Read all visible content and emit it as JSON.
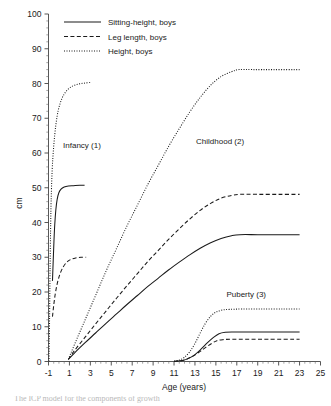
{
  "chart_data": {
    "type": "line",
    "title": "",
    "xlabel": "Age (years)",
    "ylabel": "cm",
    "xlim": [
      -1,
      25
    ],
    "ylim": [
      0,
      100
    ],
    "xticks": [
      -1,
      1,
      3,
      5,
      7,
      9,
      11,
      13,
      15,
      17,
      19,
      21,
      23,
      25
    ],
    "yticks": [
      0,
      10,
      20,
      30,
      40,
      50,
      60,
      70,
      80,
      90,
      100
    ],
    "grid": false,
    "legend_position": "top-left",
    "legend": [
      {
        "label": "Sitting-height, boys",
        "style": "solid"
      },
      {
        "label": "Leg length, boys",
        "style": "dashed"
      },
      {
        "label": "Height, boys",
        "style": "dotted"
      }
    ],
    "annotations": [
      {
        "text": "Infancy (1)",
        "x": 2.2,
        "y": 61.5
      },
      {
        "text": "Childhood (2)",
        "x": 15.4,
        "y": 62.5
      },
      {
        "text": "Puberty (3)",
        "x": 17.9,
        "y": 18.6
      }
    ],
    "series": [
      {
        "name": "Infancy - Height, boys",
        "component": "infancy",
        "measure": "height",
        "style": "dotted",
        "points": [
          [
            -0.95,
            0
          ],
          [
            -0.9,
            12
          ],
          [
            -0.85,
            27
          ],
          [
            -0.8,
            38
          ],
          [
            -0.75,
            46
          ],
          [
            -0.65,
            55
          ],
          [
            -0.5,
            62
          ],
          [
            -0.3,
            68
          ],
          [
            -0.05,
            72.5
          ],
          [
            0.3,
            75.8
          ],
          [
            0.7,
            77.8
          ],
          [
            1.2,
            79.1
          ],
          [
            1.8,
            79.8
          ],
          [
            2.4,
            80.1
          ],
          [
            3.0,
            80.3
          ]
        ]
      },
      {
        "name": "Infancy - Sitting-height, boys",
        "component": "infancy",
        "measure": "sitting_height",
        "style": "solid",
        "points": [
          [
            -0.62,
            23.2
          ],
          [
            -0.55,
            29
          ],
          [
            -0.48,
            34.5
          ],
          [
            -0.4,
            39.5
          ],
          [
            -0.3,
            43.6
          ],
          [
            -0.18,
            46.5
          ],
          [
            -0.02,
            48.5
          ],
          [
            0.2,
            49.6
          ],
          [
            0.5,
            50.2
          ],
          [
            0.9,
            50.5
          ],
          [
            1.4,
            50.6
          ],
          [
            2.0,
            50.7
          ],
          [
            2.45,
            50.7
          ]
        ]
      },
      {
        "name": "Infancy - Leg length, boys",
        "component": "infancy",
        "measure": "leg_length",
        "style": "dashed",
        "points": [
          [
            -0.62,
            12.9
          ],
          [
            -0.5,
            16.2
          ],
          [
            -0.35,
            19.5
          ],
          [
            -0.15,
            22.6
          ],
          [
            0.1,
            25.2
          ],
          [
            0.4,
            27.2
          ],
          [
            0.75,
            28.6
          ],
          [
            1.15,
            29.4
          ],
          [
            1.6,
            29.8
          ],
          [
            2.1,
            30.0
          ],
          [
            2.6,
            30.0
          ]
        ]
      },
      {
        "name": "Childhood - Height, boys",
        "component": "childhood",
        "measure": "height",
        "style": "dotted",
        "points": [
          [
            0.9,
            0.6
          ],
          [
            1.5,
            5.0
          ],
          [
            2.5,
            12.0
          ],
          [
            3.5,
            19.0
          ],
          [
            4.5,
            26.0
          ],
          [
            5.5,
            32.5
          ],
          [
            6.5,
            39.0
          ],
          [
            7.5,
            45.0
          ],
          [
            8.5,
            51.0
          ],
          [
            9.5,
            56.5
          ],
          [
            10.5,
            62.0
          ],
          [
            11.5,
            67.0
          ],
          [
            12.5,
            71.8
          ],
          [
            13.5,
            76.0
          ],
          [
            14.5,
            79.5
          ],
          [
            15.5,
            82.0
          ],
          [
            16.5,
            83.4
          ],
          [
            17.2,
            84.0
          ],
          [
            18.5,
            84.0
          ],
          [
            20.5,
            84.0
          ],
          [
            23.0,
            84.0
          ]
        ]
      },
      {
        "name": "Childhood - Leg length, boys",
        "component": "childhood",
        "measure": "leg_length",
        "style": "dashed",
        "points": [
          [
            0.9,
            0.6
          ],
          [
            1.5,
            3.2
          ],
          [
            2.5,
            7.0
          ],
          [
            3.5,
            10.8
          ],
          [
            4.5,
            14.5
          ],
          [
            5.5,
            18.2
          ],
          [
            6.5,
            21.8
          ],
          [
            7.5,
            25.3
          ],
          [
            8.5,
            28.8
          ],
          [
            9.5,
            32.0
          ],
          [
            10.5,
            35.2
          ],
          [
            11.5,
            38.2
          ],
          [
            12.5,
            41.0
          ],
          [
            13.5,
            43.5
          ],
          [
            14.5,
            45.5
          ],
          [
            15.5,
            47.0
          ],
          [
            16.5,
            47.8
          ],
          [
            17.3,
            48.1
          ],
          [
            19.0,
            48.1
          ],
          [
            21.0,
            48.1
          ],
          [
            23.0,
            48.1
          ]
        ]
      },
      {
        "name": "Childhood - Sitting-height, boys",
        "component": "childhood",
        "measure": "sitting_height",
        "style": "solid",
        "points": [
          [
            0.9,
            0.6
          ],
          [
            1.5,
            2.5
          ],
          [
            2.5,
            5.4
          ],
          [
            3.5,
            8.2
          ],
          [
            4.5,
            11.0
          ],
          [
            5.5,
            13.7
          ],
          [
            6.5,
            16.4
          ],
          [
            7.5,
            19.0
          ],
          [
            8.5,
            21.6
          ],
          [
            9.5,
            24.0
          ],
          [
            10.5,
            26.4
          ],
          [
            11.5,
            28.6
          ],
          [
            12.5,
            30.7
          ],
          [
            13.5,
            32.6
          ],
          [
            14.5,
            34.2
          ],
          [
            15.5,
            35.4
          ],
          [
            16.5,
            36.2
          ],
          [
            17.3,
            36.5
          ],
          [
            19.0,
            36.5
          ],
          [
            21.0,
            36.5
          ],
          [
            23.0,
            36.5
          ]
        ]
      },
      {
        "name": "Puberty - Height, boys",
        "component": "puberty",
        "measure": "height",
        "style": "dotted",
        "points": [
          [
            11.0,
            0.1
          ],
          [
            11.5,
            0.4
          ],
          [
            12.0,
            1.2
          ],
          [
            12.5,
            2.8
          ],
          [
            13.0,
            5.2
          ],
          [
            13.5,
            8.2
          ],
          [
            14.0,
            11.0
          ],
          [
            14.5,
            13.0
          ],
          [
            15.0,
            14.2
          ],
          [
            15.6,
            14.8
          ],
          [
            16.3,
            15.0
          ],
          [
            17.5,
            15.1
          ],
          [
            19.5,
            15.1
          ],
          [
            21.5,
            15.1
          ],
          [
            23.0,
            15.1
          ]
        ]
      },
      {
        "name": "Puberty - Sitting-height, boys",
        "component": "puberty",
        "measure": "sitting_height",
        "style": "solid",
        "points": [
          [
            11.0,
            0.05
          ],
          [
            11.8,
            0.3
          ],
          [
            12.4,
            0.9
          ],
          [
            13.0,
            2.0
          ],
          [
            13.6,
            3.6
          ],
          [
            14.2,
            5.4
          ],
          [
            14.8,
            7.0
          ],
          [
            15.3,
            8.0
          ],
          [
            15.9,
            8.4
          ],
          [
            16.6,
            8.5
          ],
          [
            18.0,
            8.5
          ],
          [
            20.0,
            8.5
          ],
          [
            23.0,
            8.5
          ]
        ]
      },
      {
        "name": "Puberty - Leg length, boys",
        "component": "puberty",
        "measure": "leg_length",
        "style": "dashed",
        "points": [
          [
            11.0,
            0.05
          ],
          [
            11.7,
            0.25
          ],
          [
            12.3,
            0.8
          ],
          [
            12.9,
            1.7
          ],
          [
            13.5,
            2.9
          ],
          [
            14.0,
            4.0
          ],
          [
            14.6,
            5.2
          ],
          [
            15.1,
            6.0
          ],
          [
            15.7,
            6.3
          ],
          [
            16.4,
            6.4
          ],
          [
            18.0,
            6.4
          ],
          [
            20.0,
            6.4
          ],
          [
            23.0,
            6.4
          ]
        ]
      }
    ]
  },
  "caption": {
    "text": "The ICP model for the components of growth"
  }
}
